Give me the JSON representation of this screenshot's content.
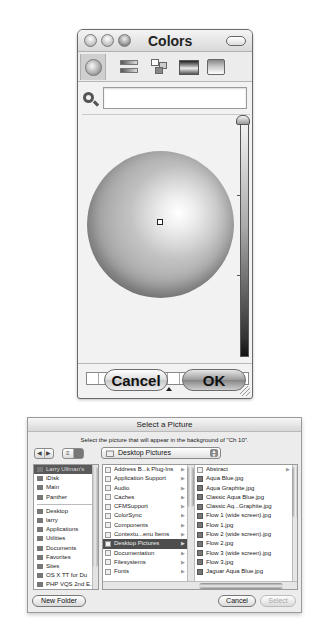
{
  "colors_window": {
    "title": "Colors",
    "tabs": [
      {
        "name": "color-wheel",
        "icon": "color-wheel-icon",
        "active": true
      },
      {
        "name": "color-sliders",
        "icon": "sliders-icon"
      },
      {
        "name": "color-palettes",
        "icon": "palettes-icon"
      },
      {
        "name": "image-palettes",
        "icon": "spectrum-icon"
      },
      {
        "name": "crayons",
        "icon": "crayons-icon"
      }
    ],
    "search": {
      "value": "",
      "placeholder": ""
    },
    "swatch_count": 14,
    "buttons": {
      "cancel": "Cancel",
      "ok": "OK"
    }
  },
  "select_dialog": {
    "title": "Select a Picture",
    "message": "Select the picture that will appear in the background of \"Ch 10\".",
    "nav": {
      "back": "◀",
      "forward": "▶"
    },
    "location": "Desktop Pictures",
    "sidebar": {
      "devices": [
        {
          "label": "Larry Ullman's",
          "selected": true
        },
        {
          "label": "iDisk"
        },
        {
          "label": "Main"
        },
        {
          "label": "Panther"
        }
      ],
      "places": [
        {
          "label": "Desktop"
        },
        {
          "label": "larry"
        },
        {
          "label": "Applications"
        },
        {
          "label": "Utilities"
        },
        {
          "label": "Documents"
        },
        {
          "label": "Favorites"
        },
        {
          "label": "Sites"
        },
        {
          "label": "OS X TT for Du"
        },
        {
          "label": "PHP VQS 2nd E..."
        }
      ]
    },
    "column1": [
      {
        "label": "Address B...k Plug-Ins"
      },
      {
        "label": "Application Support"
      },
      {
        "label": "Audio"
      },
      {
        "label": "Caches"
      },
      {
        "label": "CFMSupport"
      },
      {
        "label": "ColorSync"
      },
      {
        "label": "Components"
      },
      {
        "label": "Contextu...enu Items"
      },
      {
        "label": "Desktop Pictures",
        "selected": true
      },
      {
        "label": "Documentation"
      },
      {
        "label": "Filesystems"
      },
      {
        "label": "Fonts"
      }
    ],
    "column2": [
      {
        "label": "Abstract",
        "folder": true
      },
      {
        "label": "Aqua Blue.jpg"
      },
      {
        "label": "Aqua Graphite.jpg"
      },
      {
        "label": "Classic Aqua Blue.jpg"
      },
      {
        "label": "Classic Aq...Graphite.jpg"
      },
      {
        "label": "Flow 1 (wide screen).jpg"
      },
      {
        "label": "Flow 1.jpg"
      },
      {
        "label": "Flow 2 (wide screen).jpg"
      },
      {
        "label": "Flow 2.jpg"
      },
      {
        "label": "Flow 3 (wide screen).jpg"
      },
      {
        "label": "Flow 3.jpg"
      },
      {
        "label": "Jaguar Aqua Blue.jpg"
      }
    ],
    "buttons": {
      "new_folder": "New Folder",
      "cancel": "Cancel",
      "select": "Select"
    }
  }
}
